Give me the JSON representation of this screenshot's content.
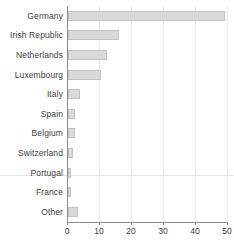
{
  "chart_data": {
    "type": "bar",
    "orientation": "horizontal",
    "title": "",
    "xlabel": "",
    "ylabel": "",
    "xlim": [
      0,
      50
    ],
    "xticks": [
      0,
      10,
      20,
      30,
      40,
      50
    ],
    "grid": "vertical",
    "legend": "none",
    "categories": [
      "Germany",
      "Irish Republic",
      "Netherlands",
      "Luxembourg",
      "Italy",
      "Spain",
      "Belgium",
      "Switzerland",
      "Portugal",
      "France",
      "Other"
    ],
    "values": [
      49,
      16,
      12.3,
      10.2,
      3.8,
      2.2,
      2.1,
      1.5,
      0.9,
      0.8,
      3.2
    ]
  },
  "style": {
    "bar_fill": "#d9d9d9",
    "bar_stroke": "#c2c2c2",
    "axis_color": "#8c8c8c",
    "grid_color": "#e8e8e8",
    "text_color": "#3c3c3c",
    "background": "#ffffff"
  }
}
